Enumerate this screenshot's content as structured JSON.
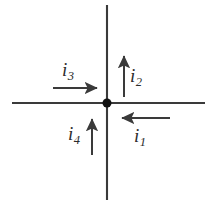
{
  "figure": {
    "name": "current-junction-diagram",
    "background_color": "#ffffff",
    "stroke_color": "#3a3a3a",
    "node_color": "#111111",
    "label_color": "#2b2b2b"
  },
  "node": {
    "label": "junction-node",
    "cx": 107,
    "cy": 103,
    "r": 4.5
  },
  "wires": [
    {
      "name": "horizontal-wire",
      "x1": 12,
      "y1": 103,
      "x2": 205,
      "y2": 103
    },
    {
      "name": "vertical-wire",
      "x1": 107,
      "y1": 5,
      "x2": 107,
      "y2": 200
    }
  ],
  "currents": [
    {
      "id": "i1",
      "symbol": "i",
      "subscript": "1",
      "direction": "left",
      "arrow": {
        "x1": 170,
        "y1": 118,
        "x2": 116,
        "y2": 118
      }
    },
    {
      "id": "i2",
      "symbol": "i",
      "subscript": "2",
      "direction": "up",
      "arrow": {
        "x1": 124,
        "y1": 97,
        "x2": 124,
        "y2": 50
      }
    },
    {
      "id": "i3",
      "symbol": "i",
      "subscript": "3",
      "direction": "right",
      "arrow": {
        "x1": 53,
        "y1": 88,
        "x2": 103,
        "y2": 88
      }
    },
    {
      "id": "i4",
      "symbol": "i",
      "subscript": "4",
      "direction": "up",
      "arrow": {
        "x1": 92,
        "y1": 155,
        "x2": 92,
        "y2": 113
      }
    }
  ]
}
